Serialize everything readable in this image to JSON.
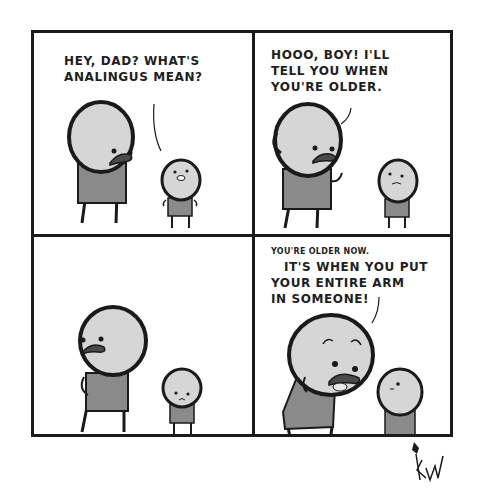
{
  "comic": {
    "panels": [
      {
        "id": 1,
        "speaker": "son",
        "caption_lines": [
          "HEY, DAD? WHAT'S",
          "ANALINGUS MEAN?"
        ]
      },
      {
        "id": 2,
        "speaker": "dad",
        "caption_lines": [
          "HOOO, BOY! I'LL",
          "TELL YOU WHEN",
          "YOU'RE OLDER."
        ]
      },
      {
        "id": 3,
        "speaker": null,
        "caption_lines": []
      },
      {
        "id": 4,
        "speaker": "dad",
        "small_caption": "YOU'RE OLDER NOW.",
        "caption_lines": [
          "IT'S WHEN YOU PUT",
          "YOUR ENTIRE ARM",
          "IN SOMEONE!"
        ]
      }
    ],
    "signature": "KW",
    "colors": {
      "ink": "#1a1a1a",
      "skin": "#d6d6d6",
      "shirt": "#8a8a8a",
      "background": "#ffffff"
    }
  }
}
